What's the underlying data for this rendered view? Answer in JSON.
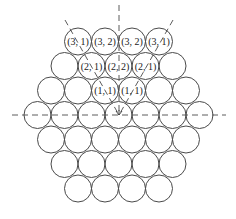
{
  "diagram": {
    "colors": {
      "background": "#ffffff",
      "stroke": "#4a4a4a",
      "text": "#222222"
    },
    "geometry": {
      "circle_diameter": 27,
      "center_x": 118.5,
      "row_centers_y": [
        41.5,
        66,
        90.5,
        115,
        139.5,
        164,
        188.5
      ],
      "row_counts": [
        4,
        5,
        6,
        7,
        6,
        5,
        4
      ]
    },
    "axes": [
      {
        "name": "horizontal-axis",
        "x1": 12,
        "y1": 115,
        "x2": 226,
        "y2": 115
      },
      {
        "name": "vertical-axis",
        "x1": 119,
        "y1": 5,
        "x2": 119,
        "y2": 115
      },
      {
        "name": "left-diagonal-axis",
        "x1": 65,
        "y1": 20,
        "x2": 119,
        "y2": 115
      },
      {
        "name": "right-diagonal-axis",
        "x1": 173,
        "y1": 20,
        "x2": 119,
        "y2": 115
      }
    ],
    "labels": {
      "row1": [
        "(3, 1)",
        "(3, 2)",
        "(3, 2)",
        "(3, 1)"
      ],
      "row2": [
        "",
        "(2, 1)",
        "(2, 2)",
        "(2, 1)",
        ""
      ],
      "row3": [
        "",
        "",
        "(1, 1)",
        "(1, 1)",
        "",
        ""
      ],
      "row4": [
        "",
        "",
        "",
        "",
        "",
        "",
        ""
      ],
      "row5": [
        "",
        "",
        "",
        "",
        "",
        ""
      ],
      "row6": [
        "",
        "",
        "",
        "",
        ""
      ],
      "row7": [
        "",
        "",
        "",
        ""
      ]
    }
  }
}
